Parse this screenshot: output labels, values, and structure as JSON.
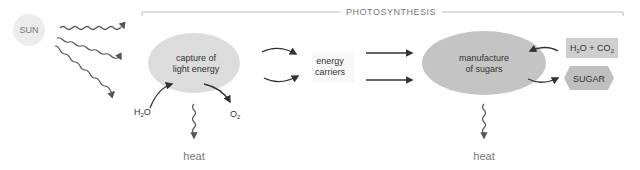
{
  "title": "PHOTOSYNTHESIS",
  "sun": {
    "label": "SUN"
  },
  "capture": {
    "line1": "capture of",
    "line2": "light energy",
    "input": "H",
    "input_sub": "2",
    "input_tail": "O",
    "output": "O",
    "output_sub": "2"
  },
  "carriers": {
    "line1": "energy",
    "line2": "carriers"
  },
  "manufacture": {
    "line1": "manufacture",
    "line2": "of sugars"
  },
  "inputs_box": {
    "h": "H",
    "h_sub": "2",
    "mid": "O + CO",
    "co_sub": "2"
  },
  "sugar": {
    "label": "SUGAR"
  },
  "heat_left": "heat",
  "heat_right": "heat",
  "colors": {
    "ellipse_light": "#dcdcdc",
    "ellipse_dark": "#c4c4c4",
    "arrow": "#333333",
    "wavy": "#666666",
    "box": "#cfcfcf",
    "hex": "#bfbfbf",
    "sun": "#ececec",
    "bracket": "#bbbbbb"
  }
}
